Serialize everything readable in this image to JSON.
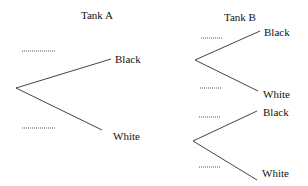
{
  "diagram": {
    "type": "probability-tree",
    "tank_a": {
      "title": "Tank A",
      "branches": [
        {
          "label": "Black",
          "probability": "........."
        },
        {
          "label": "White",
          "probability": "........."
        }
      ]
    },
    "tank_b": {
      "title": "Tank B",
      "subtrees": [
        {
          "branches": [
            {
              "label": "Black",
              "probability": "........."
            },
            {
              "label": "White",
              "probability": "........."
            }
          ]
        },
        {
          "branches": [
            {
              "label": "Black",
              "probability": "........."
            },
            {
              "label": "White",
              "probability": "........."
            }
          ]
        }
      ]
    }
  }
}
